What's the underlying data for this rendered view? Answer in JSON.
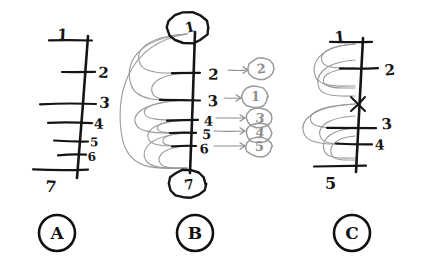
{
  "figure": {
    "background_color": "#ffffff",
    "ink_color": "#151515",
    "faint_ink_color": "#9a9a9a",
    "arrow_color": "#8d8d8d"
  },
  "panels": [
    {
      "id": "A",
      "letter": "A",
      "letter_center": {
        "x": 57,
        "y": 233
      },
      "letter_radius": 18,
      "spine": {
        "x_top": 88,
        "y_top": 36,
        "x_bottom": 77,
        "y_bottom": 178
      },
      "ticks": [
        {
          "label": "1",
          "y": 40,
          "x_left": 49,
          "x_right": 92,
          "label_x": 57,
          "label_y": 34,
          "label_size": 15
        },
        {
          "label": "2",
          "y": 72,
          "x_left": 62,
          "x_right": 95,
          "label_x": 98,
          "label_y": 72,
          "label_size": 15
        },
        {
          "label": "3",
          "y": 104,
          "x_left": 40,
          "x_right": 96,
          "label_x": 99,
          "label_y": 102,
          "label_size": 15
        },
        {
          "label": "4",
          "y": 123,
          "x_left": 48,
          "x_right": 92,
          "label_x": 94,
          "label_y": 124,
          "label_size": 14
        },
        {
          "label": "5",
          "y": 141,
          "x_left": 54,
          "x_right": 88,
          "label_x": 90,
          "label_y": 142,
          "label_size": 12
        },
        {
          "label": "6",
          "y": 155,
          "x_left": 58,
          "x_right": 86,
          "label_x": 88,
          "label_y": 157,
          "label_size": 12
        },
        {
          "label": "7",
          "y": 170,
          "x_left": 33,
          "x_right": 88,
          "label_x": 45,
          "label_y": 186,
          "label_size": 16
        }
      ],
      "arcs": [],
      "mappings": [],
      "cross_marks": []
    },
    {
      "id": "B",
      "letter": "B",
      "letter_center": {
        "x": 195,
        "y": 233
      },
      "letter_radius": 18,
      "spine": {
        "x_top": 195,
        "y_top": 32,
        "x_bottom": 190,
        "y_bottom": 173
      },
      "ticks": [
        {
          "label": "2",
          "y": 73,
          "x_left": 172,
          "x_right": 200,
          "label_x": 208,
          "label_y": 74,
          "label_size": 15
        },
        {
          "label": "3",
          "y": 100,
          "x_left": 160,
          "x_right": 200,
          "label_x": 208,
          "label_y": 101,
          "label_size": 15
        },
        {
          "label": "4",
          "y": 120,
          "x_left": 167,
          "x_right": 198,
          "label_x": 204,
          "label_y": 121,
          "label_size": 13
        },
        {
          "label": "5",
          "y": 133,
          "x_left": 170,
          "x_right": 196,
          "label_x": 202,
          "label_y": 134,
          "label_size": 13
        },
        {
          "label": "6",
          "y": 146,
          "x_left": 172,
          "x_right": 196,
          "label_x": 200,
          "label_y": 149,
          "label_size": 13
        }
      ],
      "endpoint_top": {
        "label": "1",
        "circle": {
          "cx": 188,
          "cy": 28,
          "rx": 21,
          "ry": 16
        },
        "label_x": 186,
        "label_y": 33,
        "label_size": 14
      },
      "endpoint_bottom": {
        "label": "7",
        "circle": {
          "cx": 187,
          "cy": 184,
          "rx": 19,
          "ry": 14
        },
        "label_x": 185,
        "label_y": 190,
        "label_size": 14
      },
      "arcs": [
        {
          "from_y": 34,
          "to_y": 73,
          "bulge": 52
        },
        {
          "from_y": 34,
          "to_y": 100,
          "bulge": 62
        },
        {
          "from_y": 73,
          "to_y": 100,
          "bulge": 38
        },
        {
          "from_y": 100,
          "to_y": 120,
          "bulge": 46
        },
        {
          "from_y": 100,
          "to_y": 133,
          "bulge": 56
        },
        {
          "from_y": 120,
          "to_y": 133,
          "bulge": 32
        },
        {
          "from_y": 120,
          "to_y": 146,
          "bulge": 42
        },
        {
          "from_y": 133,
          "to_y": 146,
          "bulge": 26
        },
        {
          "from_y": 133,
          "to_y": 168,
          "bulge": 46
        },
        {
          "from_y": 146,
          "to_y": 168,
          "bulge": 30
        },
        {
          "from_y": 34,
          "to_y": 168,
          "bulge": 72
        }
      ],
      "mappings": [
        {
          "source": "2",
          "target": "2",
          "arrow_y": 70,
          "arrow_x1": 228,
          "arrow_x2": 248,
          "circle_cx": 261,
          "circle_cy": 69,
          "rx": 13,
          "ry": 11
        },
        {
          "source": "3",
          "target": "1",
          "arrow_y": 98,
          "arrow_x1": 224,
          "arrow_x2": 241,
          "circle_cx": 255,
          "circle_cy": 97,
          "rx": 13,
          "ry": 11
        },
        {
          "source": "4",
          "target": "3",
          "arrow_y": 118,
          "arrow_x1": 216,
          "arrow_x2": 245,
          "circle_cx": 259,
          "circle_cy": 118,
          "rx": 13,
          "ry": 10
        },
        {
          "source": "5",
          "target": "4",
          "arrow_y": 131,
          "arrow_x1": 214,
          "arrow_x2": 245,
          "circle_cx": 259,
          "circle_cy": 133,
          "rx": 13,
          "ry": 10
        },
        {
          "source": "6",
          "target": "5",
          "arrow_y": 146,
          "arrow_x1": 214,
          "arrow_x2": 245,
          "circle_cx": 259,
          "circle_cy": 147,
          "rx": 13,
          "ry": 10
        }
      ],
      "cross_marks": []
    },
    {
      "id": "C",
      "letter": "C",
      "letter_center": {
        "x": 352,
        "y": 233
      },
      "letter_radius": 18,
      "spine": {
        "x_top": 363,
        "y_top": 38,
        "x_bottom": 356,
        "y_bottom": 172
      },
      "ticks": [
        {
          "label": "1",
          "y": 42,
          "x_left": 330,
          "x_right": 372,
          "label_x": 335,
          "label_y": 37,
          "label_size": 15
        },
        {
          "label": "2",
          "y": 68,
          "x_left": 340,
          "x_right": 378,
          "label_x": 385,
          "label_y": 70,
          "label_size": 15
        },
        {
          "label": "3",
          "y": 128,
          "x_left": 327,
          "x_right": 376,
          "label_x": 382,
          "label_y": 124,
          "label_size": 15
        },
        {
          "label": "4",
          "y": 144,
          "x_left": 336,
          "x_right": 372,
          "label_x": 375,
          "label_y": 145,
          "label_size": 14
        },
        {
          "label": "5",
          "y": 166,
          "x_left": 314,
          "x_right": 366,
          "label_x": 325,
          "label_y": 183,
          "label_size": 16
        }
      ],
      "cross_marks": [
        {
          "x": 358,
          "y": 104,
          "size": 7
        }
      ],
      "arcs": [
        {
          "from_y": 44,
          "to_y": 68,
          "bulge": 36
        },
        {
          "from_y": 44,
          "to_y": 86,
          "bulge": 44
        },
        {
          "from_y": 68,
          "to_y": 88,
          "bulge": 34
        },
        {
          "from_y": 60,
          "to_y": 96,
          "bulge": 40
        },
        {
          "from_y": 104,
          "to_y": 128,
          "bulge": 48
        },
        {
          "from_y": 104,
          "to_y": 144,
          "bulge": 56
        },
        {
          "from_y": 116,
          "to_y": 144,
          "bulge": 38
        },
        {
          "from_y": 128,
          "to_y": 158,
          "bulge": 34
        },
        {
          "from_y": 136,
          "to_y": 160,
          "bulge": 26
        }
      ],
      "mappings": []
    }
  ]
}
